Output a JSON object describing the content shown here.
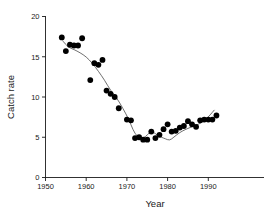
{
  "chart_data": {
    "type": "scatter",
    "title": "",
    "xlabel": "Year",
    "ylabel": "Catch rate",
    "xlim": [
      1950,
      1994
    ],
    "ylim": [
      0,
      20
    ],
    "xticks": [
      1950,
      1960,
      1970,
      1980,
      1990
    ],
    "yticks": [
      0,
      5,
      10,
      15,
      20
    ],
    "grid": false,
    "legend": null,
    "series": [
      {
        "name": "Catch rate",
        "marker": "filled-circle",
        "color": "#000000",
        "points": [
          {
            "x": 1954,
            "y": 17.4
          },
          {
            "x": 1955,
            "y": 15.7
          },
          {
            "x": 1956,
            "y": 16.5
          },
          {
            "x": 1957,
            "y": 16.4
          },
          {
            "x": 1958,
            "y": 16.4
          },
          {
            "x": 1959,
            "y": 17.3
          },
          {
            "x": 1961,
            "y": 12.1
          },
          {
            "x": 1962,
            "y": 14.2
          },
          {
            "x": 1963,
            "y": 14.0
          },
          {
            "x": 1964,
            "y": 14.6
          },
          {
            "x": 1965,
            "y": 10.8
          },
          {
            "x": 1966,
            "y": 10.4
          },
          {
            "x": 1967,
            "y": 10.0
          },
          {
            "x": 1968,
            "y": 8.6
          },
          {
            "x": 1970,
            "y": 7.2
          },
          {
            "x": 1971,
            "y": 7.1
          },
          {
            "x": 1972,
            "y": 4.9
          },
          {
            "x": 1973,
            "y": 5.0
          },
          {
            "x": 1974,
            "y": 4.7
          },
          {
            "x": 1975,
            "y": 4.7
          },
          {
            "x": 1976,
            "y": 5.7
          },
          {
            "x": 1977,
            "y": 4.9
          },
          {
            "x": 1978,
            "y": 5.3
          },
          {
            "x": 1979,
            "y": 6.0
          },
          {
            "x": 1980,
            "y": 6.6
          },
          {
            "x": 1981,
            "y": 5.7
          },
          {
            "x": 1982,
            "y": 5.8
          },
          {
            "x": 1983,
            "y": 6.2
          },
          {
            "x": 1984,
            "y": 6.4
          },
          {
            "x": 1985,
            "y": 7.0
          },
          {
            "x": 1986,
            "y": 6.6
          },
          {
            "x": 1987,
            "y": 6.3
          },
          {
            "x": 1988,
            "y": 7.1
          },
          {
            "x": 1989,
            "y": 7.2
          },
          {
            "x": 1990,
            "y": 7.2
          },
          {
            "x": 1991,
            "y": 7.2
          },
          {
            "x": 1992,
            "y": 7.7
          }
        ]
      }
    ],
    "trend": {
      "name": "smoothed-trend",
      "color": "#4a4a4a",
      "points": [
        {
          "x": 1954.2,
          "y": 17.0
        },
        {
          "x": 1955.5,
          "y": 16.2
        },
        {
          "x": 1957.0,
          "y": 15.9
        },
        {
          "x": 1958.5,
          "y": 15.5
        },
        {
          "x": 1960.0,
          "y": 15.0
        },
        {
          "x": 1961.5,
          "y": 14.2
        },
        {
          "x": 1963.0,
          "y": 13.2
        },
        {
          "x": 1964.5,
          "y": 12.1
        },
        {
          "x": 1966.0,
          "y": 10.8
        },
        {
          "x": 1967.5,
          "y": 9.9
        },
        {
          "x": 1969.0,
          "y": 8.6
        },
        {
          "x": 1970.5,
          "y": 7.2
        },
        {
          "x": 1971.5,
          "y": 5.9
        },
        {
          "x": 1972.5,
          "y": 5.1
        },
        {
          "x": 1973.5,
          "y": 4.9
        },
        {
          "x": 1974.5,
          "y": 5.0
        },
        {
          "x": 1975.5,
          "y": 5.6
        },
        {
          "x": 1976.5,
          "y": 5.7
        },
        {
          "x": 1977.5,
          "y": 5.2
        },
        {
          "x": 1978.5,
          "y": 5.0
        },
        {
          "x": 1979.5,
          "y": 4.8
        },
        {
          "x": 1980.5,
          "y": 4.6
        },
        {
          "x": 1981.5,
          "y": 5.0
        },
        {
          "x": 1983.0,
          "y": 5.6
        },
        {
          "x": 1984.5,
          "y": 6.0
        },
        {
          "x": 1986.0,
          "y": 6.3
        },
        {
          "x": 1987.5,
          "y": 6.6
        },
        {
          "x": 1989.0,
          "y": 7.0
        },
        {
          "x": 1990.5,
          "y": 7.8
        },
        {
          "x": 1991.5,
          "y": 8.4
        }
      ]
    }
  },
  "figure": {
    "background_color": "#ffffff",
    "axis_color": "#1a1a1a",
    "marker_color": "#000000",
    "trend_color": "#4a4a4a"
  }
}
